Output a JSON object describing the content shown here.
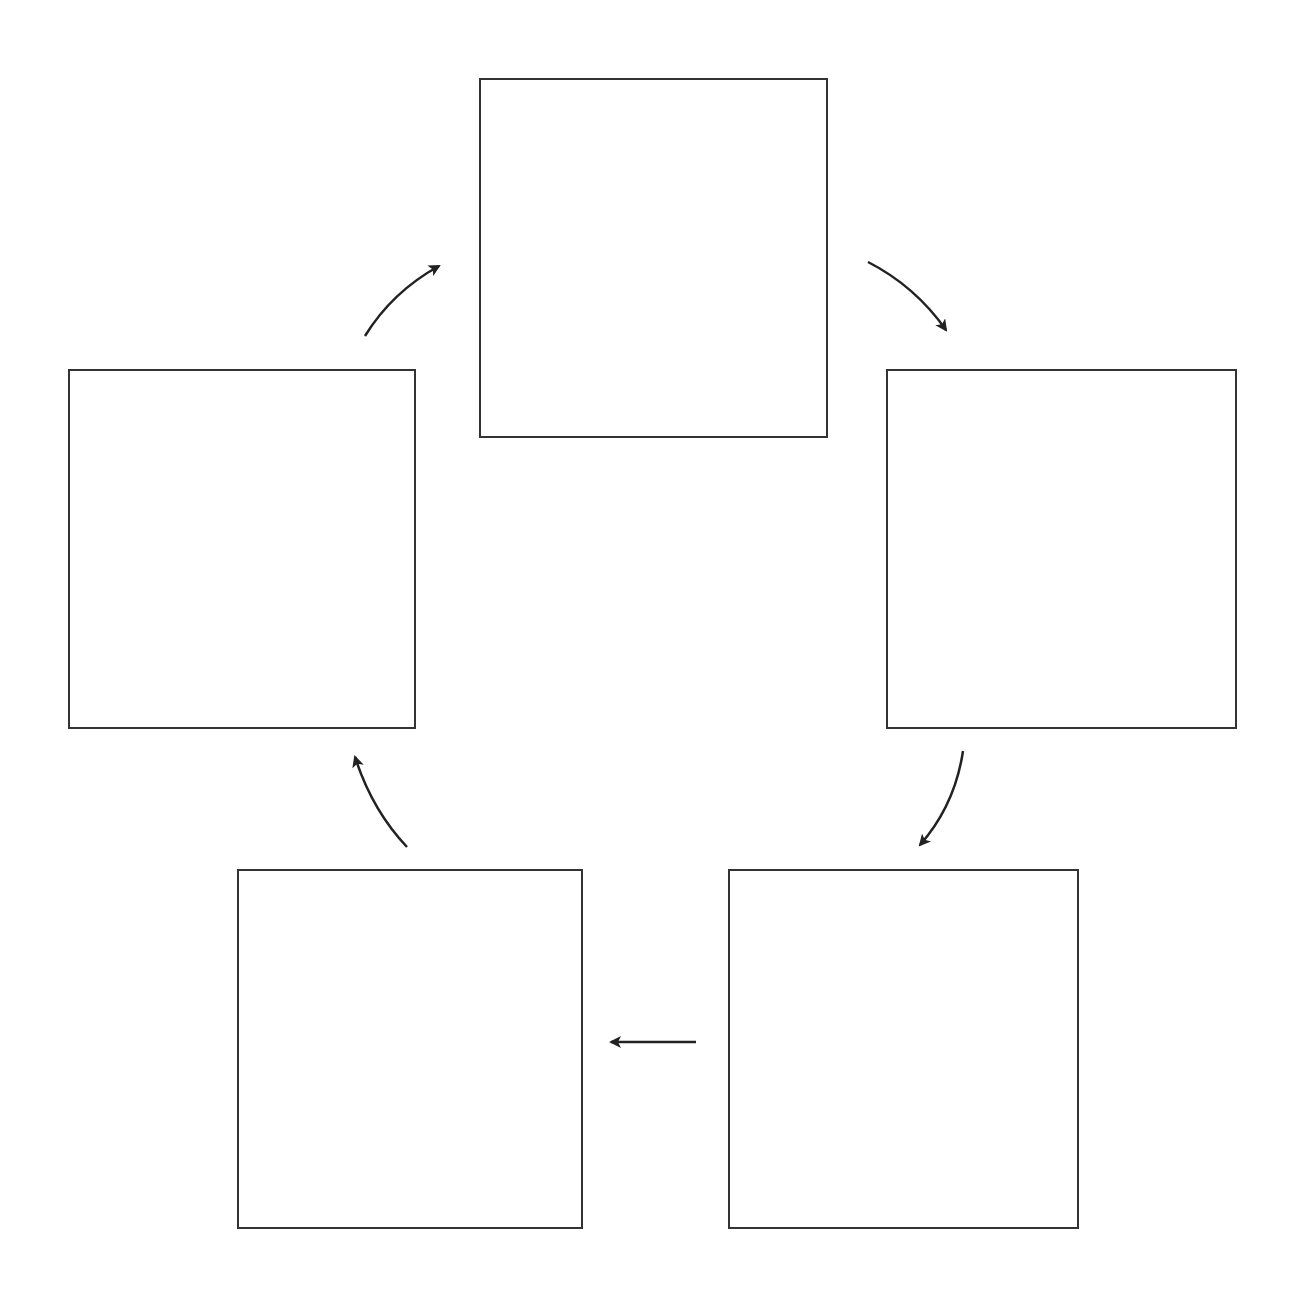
{
  "diagram": {
    "type": "cycle",
    "stroke_color": "#333333",
    "background": "#ffffff",
    "boxes": [
      {
        "id": "top",
        "label": "",
        "x": 479,
        "y": 78,
        "w": 349,
        "h": 360
      },
      {
        "id": "right",
        "label": "",
        "x": 886,
        "y": 369,
        "w": 351,
        "h": 360
      },
      {
        "id": "bottom-right",
        "label": "",
        "x": 728,
        "y": 869,
        "w": 351,
        "h": 360
      },
      {
        "id": "bottom-left",
        "label": "",
        "x": 237,
        "y": 869,
        "w": 346,
        "h": 360
      },
      {
        "id": "left",
        "label": "",
        "x": 68,
        "y": 369,
        "w": 348,
        "h": 360
      }
    ],
    "arrows": [
      {
        "from": "left",
        "to": "top"
      },
      {
        "from": "top",
        "to": "right"
      },
      {
        "from": "right",
        "to": "bottom-right"
      },
      {
        "from": "bottom-right",
        "to": "bottom-left"
      },
      {
        "from": "bottom-left",
        "to": "left"
      }
    ]
  }
}
